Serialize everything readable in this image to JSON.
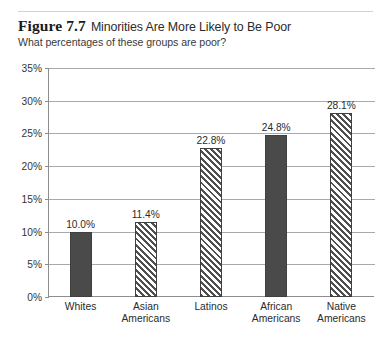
{
  "figure": {
    "number_label": "Figure 7.7",
    "title": "Minorities Are More Likely to Be Poor",
    "subtitle": "What percentages of these groups are poor?"
  },
  "chart_data": {
    "type": "bar",
    "title": "Minorities Are More Likely to Be Poor",
    "subtitle": "What percentages of these groups are poor?",
    "xlabel": "",
    "ylabel": "",
    "ylim": [
      0,
      35
    ],
    "ytick_step": 5,
    "ytick_labels": [
      "0%",
      "5%",
      "10%",
      "15%",
      "20%",
      "25%",
      "30%",
      "35%"
    ],
    "ytick_values": [
      0,
      5,
      10,
      15,
      20,
      25,
      30,
      35
    ],
    "grid": true,
    "legend": "none",
    "categories": [
      "Whites",
      "Asian Americans",
      "Latinos",
      "African Americans",
      "Native Americans"
    ],
    "category_lines": [
      [
        "Whites"
      ],
      [
        "Asian",
        "Americans"
      ],
      [
        "Latinos"
      ],
      [
        "African",
        "Americans"
      ],
      [
        "Native",
        "Americans"
      ]
    ],
    "values": [
      10.0,
      11.4,
      22.8,
      24.8,
      28.1
    ],
    "value_labels": [
      "10.0%",
      "11.4%",
      "22.8%",
      "24.8%",
      "28.1%"
    ],
    "bar_fills": [
      "solid",
      "hatch",
      "hatch",
      "solid",
      "hatch"
    ],
    "colors": {
      "bar_solid": "#4a4a4a",
      "bar_hatch_stroke": "#4f4f4f",
      "bar_outline": "#3f3f3f",
      "gridline": "#a9a9a9",
      "axis": "#8d8d8d",
      "text": "#2b2b2b",
      "background": "#ffffff",
      "top_rule": "#d2d2d2"
    }
  }
}
